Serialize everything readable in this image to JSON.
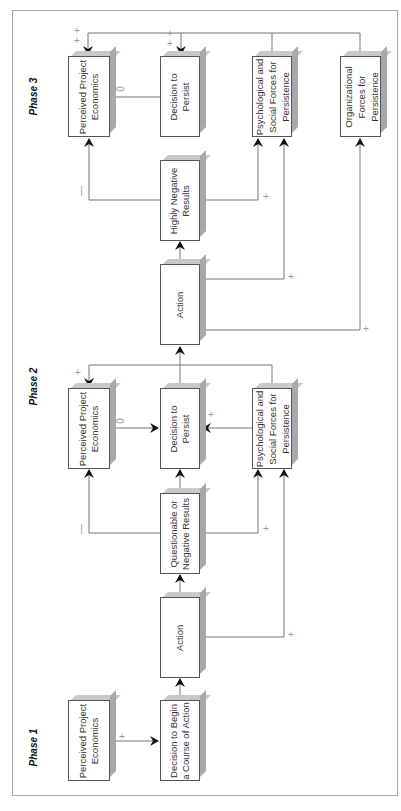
{
  "diagram": {
    "type": "escalation-of-commitment flow model (rotated 90° counter-clockwise)",
    "phases": [
      {
        "label": "Phase 1",
        "boxes": {
          "perceived": "Perceived Project Economics",
          "decision": "Decision to Begin a Course of Action"
        }
      },
      {
        "label": "Phase 2",
        "boxes": {
          "action": "Action",
          "results": "Questionable or Negative Results",
          "perceived": "Perceived Project Economics",
          "decision": "Decision to Persist",
          "psych": "Psychological and Social Forces for Persistence"
        }
      },
      {
        "label": "Phase 3",
        "boxes": {
          "action": "Action",
          "results": "Highly Negative Results",
          "perceived": "Perceived Project Economics",
          "decision": "Decision to Persist",
          "psych": "Psychological and Social Forces for Persistence",
          "org": "Organizational Forces for Persistence"
        }
      }
    ],
    "signs": {
      "plus": "+",
      "minus": "—",
      "zero": "0"
    },
    "edges": [
      {
        "from": "Phase 1 Perceived Project Economics",
        "to": "Decision to Begin a Course of Action",
        "sign": "+"
      },
      {
        "from": "Decision to Begin a Course of Action",
        "to": "Phase 2 Action",
        "sign": ""
      },
      {
        "from": "Phase 2 Action",
        "to": "Questionable or Negative Results",
        "sign": ""
      },
      {
        "from": "Phase 2 Action",
        "to": "Phase 2 Psychological and Social Forces",
        "sign": "+"
      },
      {
        "from": "Questionable or Negative Results",
        "to": "Phase 2 Perceived Project Economics",
        "sign": "—"
      },
      {
        "from": "Questionable or Negative Results",
        "to": "Phase 2 Psychological and Social Forces",
        "sign": "+"
      },
      {
        "from": "Questionable or Negative Results",
        "to": "Phase 2 Decision to Persist",
        "sign": ""
      },
      {
        "from": "Phase 2 Perceived Project Economics",
        "to": "Phase 2 Decision to Persist",
        "sign": "0"
      },
      {
        "from": "Phase 2 Psychological and Social Forces",
        "to": "Phase 2 Decision to Persist",
        "sign": "+"
      },
      {
        "from": "Phase 2 Decision to Persist",
        "to": "Phase 3 Action",
        "sign": ""
      },
      {
        "from": "Phase 2 Psychological and Social Forces",
        "to": "Phase 2 Perceived Project Economics",
        "sign": "+"
      },
      {
        "from": "Phase 3 Action",
        "to": "Highly Negative Results",
        "sign": ""
      },
      {
        "from": "Phase 3 Action",
        "to": "Phase 3 Psychological and Social Forces",
        "sign": "+"
      },
      {
        "from": "Phase 3 Action",
        "to": "Organizational Forces for Persistence",
        "sign": "+"
      },
      {
        "from": "Highly Negative Results",
        "to": "Phase 3 Perceived Project Economics",
        "sign": "—"
      },
      {
        "from": "Highly Negative Results",
        "to": "Phase 3 Psychological and Social Forces",
        "sign": "+"
      },
      {
        "from": "Highly Negative Results",
        "to": "Phase 3 Decision to Persist",
        "sign": ""
      },
      {
        "from": "Phase 3 Perceived Project Economics",
        "to": "Phase 3 Decision to Persist",
        "sign": "0"
      },
      {
        "from": "Phase 3 Psychological and Social Forces",
        "to": "Phase 3 Perceived Project Economics",
        "sign": "+"
      },
      {
        "from": "Phase 3 Psychological and Social Forces",
        "to": "Phase 3 Decision to Persist",
        "sign": "+"
      },
      {
        "from": "Organizational Forces for Persistence",
        "to": "Phase 3 Perceived Project Economics",
        "sign": "+"
      },
      {
        "from": "Organizational Forces for Persistence",
        "to": "Phase 3 Decision to Persist",
        "sign": "+"
      }
    ]
  }
}
